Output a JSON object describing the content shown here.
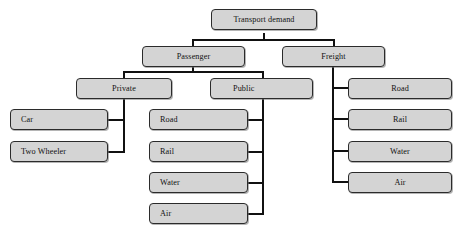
{
  "diagram": {
    "type": "tree",
    "colors": {
      "node_fill": "#d4d4d4",
      "node_border": "#2b2b2b",
      "connector": "#111111",
      "background": "#ffffff"
    },
    "nodes": {
      "root": {
        "label": "Transport demand"
      },
      "passenger": {
        "label": "Passenger"
      },
      "freight": {
        "label": "Freight"
      },
      "private": {
        "label": "Private"
      },
      "public": {
        "label": "Public"
      },
      "private_children": [
        {
          "label": "Car"
        },
        {
          "label": "Two Wheeler"
        }
      ],
      "public_children": [
        {
          "label": "Road"
        },
        {
          "label": "Rail"
        },
        {
          "label": "Water"
        },
        {
          "label": "Air"
        }
      ],
      "freight_children": [
        {
          "label": "Road"
        },
        {
          "label": "Rail"
        },
        {
          "label": "Water"
        },
        {
          "label": "Air"
        }
      ]
    },
    "edges": [
      {
        "from": "root",
        "to": "passenger"
      },
      {
        "from": "root",
        "to": "freight"
      },
      {
        "from": "passenger",
        "to": "private"
      },
      {
        "from": "passenger",
        "to": "public"
      },
      {
        "from": "private",
        "to": "Car"
      },
      {
        "from": "private",
        "to": "Two Wheeler"
      },
      {
        "from": "public",
        "to": "Road"
      },
      {
        "from": "public",
        "to": "Rail"
      },
      {
        "from": "public",
        "to": "Water"
      },
      {
        "from": "public",
        "to": "Air"
      },
      {
        "from": "freight",
        "to": "Road"
      },
      {
        "from": "freight",
        "to": "Rail"
      },
      {
        "from": "freight",
        "to": "Water"
      },
      {
        "from": "freight",
        "to": "Air"
      }
    ]
  }
}
